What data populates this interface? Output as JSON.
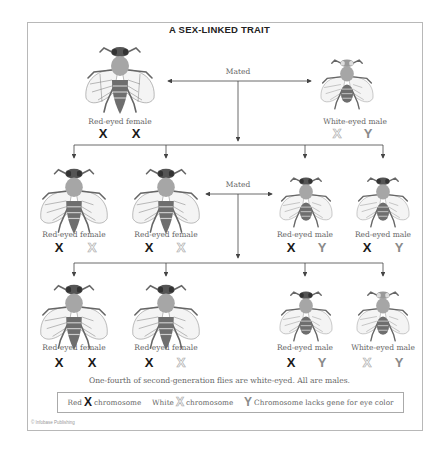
{
  "title": "A SEX-LINKED TRAIT",
  "generations": {
    "parents": {
      "mated_label": "Mated",
      "flies": [
        {
          "label": "Red-eyed female",
          "sex": "female",
          "eye": "red",
          "chromosomes": [
            "X",
            "X"
          ],
          "chromosome_types": [
            "red",
            "red"
          ]
        },
        {
          "label": "White-eyed male",
          "sex": "male",
          "eye": "white",
          "chromosomes": [
            "X",
            "Y"
          ],
          "chromosome_types": [
            "white",
            "y"
          ]
        }
      ]
    },
    "first": {
      "mated_label": "Mated",
      "flies": [
        {
          "label": "Red-eyed female",
          "sex": "female",
          "eye": "red",
          "chromosomes": [
            "X",
            "X"
          ],
          "chromosome_types": [
            "red",
            "white"
          ]
        },
        {
          "label": "Red-eyed female",
          "sex": "female",
          "eye": "red",
          "chromosomes": [
            "X",
            "X"
          ],
          "chromosome_types": [
            "red",
            "white"
          ]
        },
        {
          "label": "Red-eyed male",
          "sex": "male",
          "eye": "red",
          "chromosomes": [
            "X",
            "Y"
          ],
          "chromosome_types": [
            "red",
            "y"
          ]
        },
        {
          "label": "Red-eyed male",
          "sex": "male",
          "eye": "red",
          "chromosomes": [
            "X",
            "Y"
          ],
          "chromosome_types": [
            "red",
            "y"
          ]
        }
      ]
    },
    "second": {
      "flies": [
        {
          "label": "Red-eyed female",
          "sex": "female",
          "eye": "red",
          "chromosomes": [
            "X",
            "X"
          ],
          "chromosome_types": [
            "red",
            "red"
          ]
        },
        {
          "label": "Red-eyed female",
          "sex": "female",
          "eye": "red",
          "chromosomes": [
            "X",
            "X"
          ],
          "chromosome_types": [
            "red",
            "white"
          ]
        },
        {
          "label": "Red-eyed male",
          "sex": "male",
          "eye": "red",
          "chromosomes": [
            "X",
            "Y"
          ],
          "chromosome_types": [
            "red",
            "y"
          ]
        },
        {
          "label": "White-eyed male",
          "sex": "male",
          "eye": "white",
          "chromosomes": [
            "X",
            "Y"
          ],
          "chromosome_types": [
            "white",
            "y"
          ]
        }
      ]
    }
  },
  "caption": "One-fourth of second-generation flies are white-eyed. All are males.",
  "legend": {
    "red_prefix": "Red",
    "red_symbol": "X",
    "red_suffix": "chromosome",
    "white_prefix": "White",
    "white_symbol": "X",
    "white_suffix": "chromosome",
    "y_symbol": "Y",
    "y_text": "Chromosome lacks gene for eye color"
  },
  "copyright": "© Infobase Publishing",
  "colors": {
    "red_chromosome": "#1a1a1a",
    "white_chromosome_outline": "#b0b0b0",
    "y_chromosome": "#8a8a8a",
    "lines": "#444444",
    "frame": "#b8b8b8"
  }
}
